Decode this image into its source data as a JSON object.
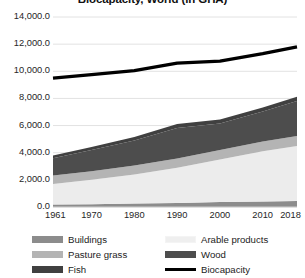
{
  "chart_data": {
    "type": "area",
    "title": "Biocapacity, World (in GHA)",
    "xlabel": "",
    "ylabel": "",
    "ylim": [
      0,
      14000
    ],
    "ytick_labels": [
      "14,000.0",
      "12,000.0",
      "10,000.0",
      "8,000.0",
      "6,000.0",
      "4,000.0",
      "2,000.0",
      "0.0"
    ],
    "ytick_values": [
      14000,
      12000,
      10000,
      8000,
      6000,
      4000,
      2000,
      0
    ],
    "xtick_labels": [
      "1961",
      "1970",
      "1980",
      "1990",
      "2000",
      "2010",
      "2018"
    ],
    "xtick_values": [
      1961,
      1970,
      1980,
      1990,
      2000,
      2010,
      2018
    ],
    "xlim": [
      1961,
      2018
    ],
    "grid": true,
    "legend_position": "bottom",
    "stacked": true,
    "x": [
      1961,
      1970,
      1980,
      1990,
      2000,
      2010,
      2018
    ],
    "series": [
      {
        "name": "Buildings",
        "color": "#8c8c8c",
        "kind": "area",
        "values": [
          180,
          210,
          250,
          300,
          360,
          410,
          440
        ]
      },
      {
        "name": "Arable products",
        "color": "#ececec",
        "kind": "area",
        "values": [
          1520,
          1790,
          2150,
          2600,
          3140,
          3690,
          4060
        ]
      },
      {
        "name": "Pasture grass",
        "color": "#b4b4b4",
        "kind": "area",
        "values": [
          620,
          640,
          660,
          680,
          700,
          720,
          730
        ]
      },
      {
        "name": "Wood",
        "color": "#4d4d4d",
        "kind": "area",
        "values": [
          1280,
          1560,
          1840,
          2240,
          1960,
          2220,
          2580
        ]
      },
      {
        "name": "Fish",
        "color": "#404040",
        "kind": "area",
        "values": [
          200,
          230,
          260,
          300,
          280,
          290,
          310
        ]
      },
      {
        "name": "Biocapacity",
        "color": "#000000",
        "kind": "line",
        "values": [
          9500,
          9750,
          10050,
          10600,
          10750,
          11300,
          11800
        ]
      }
    ]
  },
  "legend": {
    "items": [
      {
        "label": "Buildings",
        "color": "#8c8c8c",
        "type": "area"
      },
      {
        "label": "Pasture grass",
        "color": "#b4b4b4",
        "type": "area"
      },
      {
        "label": "Fish",
        "color": "#404040",
        "type": "area"
      },
      {
        "label": "Arable products",
        "color": "#efefef",
        "type": "area"
      },
      {
        "label": "Wood",
        "color": "#4d4d4d",
        "type": "area"
      },
      {
        "label": "Biocapacity",
        "color": "#000000",
        "type": "line"
      }
    ]
  },
  "colors": {
    "grid": "#e2e2e2",
    "axis": "#d0d0d0",
    "text": "#262626",
    "background": "#ffffff"
  }
}
